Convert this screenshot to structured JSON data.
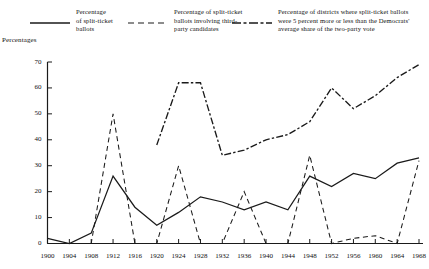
{
  "chart_data": {
    "type": "line",
    "title": "",
    "xlabel": "",
    "ylabel": "Percentages",
    "xlim": [
      1900,
      1968
    ],
    "ylim": [
      0,
      70
    ],
    "yticks": [
      0,
      10,
      20,
      30,
      40,
      50,
      60,
      70
    ],
    "x": [
      1900,
      1904,
      1908,
      1912,
      1916,
      1920,
      1924,
      1928,
      1932,
      1936,
      1940,
      1944,
      1948,
      1952,
      1956,
      1960,
      1964,
      1968
    ],
    "grid": false,
    "legend_position": "top",
    "series": [
      {
        "name": "Percentage of split-ticket ballots",
        "style": "solid",
        "color": "#1a1a1a",
        "values": [
          2,
          0,
          4,
          26,
          14,
          7,
          12,
          18,
          16,
          13,
          16,
          13,
          26,
          22,
          27,
          25,
          31,
          33
        ]
      },
      {
        "name": "Percentage of split-ticket ballots involving third-party candidates",
        "style": "dashed",
        "color": "#1a1a1a",
        "values": [
          0,
          0,
          0,
          50,
          0,
          0,
          30,
          0,
          0,
          20,
          0,
          0,
          34,
          0,
          2,
          3,
          0,
          32
        ]
      },
      {
        "name": "Percentage of districts where split-ticket ballots were 5 percent more or less than the Democrats' average share of the two-party vote",
        "style": "dash-dot",
        "color": "#1a1a1a",
        "values": [
          null,
          null,
          null,
          null,
          null,
          38,
          62,
          62,
          34,
          36,
          40,
          42,
          47,
          60,
          52,
          57,
          64,
          69
        ]
      }
    ]
  },
  "legend": {
    "entries": [
      {
        "key": "solid-line-key",
        "label": "Percentage\nof split-ticket\nballots"
      },
      {
        "key": "dashed-line-key",
        "label": "Percentage of split-ticket\nballots involving third-\nparty candidates"
      },
      {
        "key": "dash-dot-line-key",
        "label": "Percentage of districts where split-ticket ballots\nwere 5 percent more or less than the Democrats'\naverage share of the two-party vote"
      }
    ]
  },
  "axes": {
    "y_title": "Percentages",
    "y_tick_labels": [
      "70",
      "60",
      "50",
      "40",
      "30",
      "20",
      "10",
      "0"
    ],
    "x_tick_labels": [
      "1900",
      "1904",
      "1908",
      "1912",
      "1916",
      "1920",
      "1924",
      "1928",
      "1932",
      "1936",
      "1940",
      "1944",
      "1948",
      "1952",
      "1956",
      "1960",
      "1964",
      "1968"
    ]
  }
}
